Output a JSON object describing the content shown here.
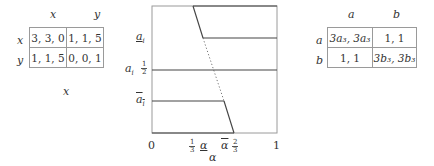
{
  "left_game": {
    "col_headers": [
      "x",
      "y"
    ],
    "row_headers": [
      "x",
      "y"
    ],
    "cells": [
      [
        "3, 3, 0",
        "1, 1, 5"
      ],
      [
        "1, 1, 5",
        "0, 0, 1"
      ]
    ],
    "bottom_label": "x"
  },
  "graph": {
    "x_axis_label": "α",
    "x_ticks": {
      "zero": "0",
      "one_third_num": "1",
      "one_third_den": "3",
      "alpha_lower": "α",
      "alpha_upper": "α",
      "two_thirds_num": "2",
      "two_thirds_den": "3",
      "one": "1"
    },
    "y_ticks": {
      "a_lower": "a",
      "a_i": "a",
      "a_i_sub": "i",
      "a_lower_sub": "i",
      "half_num": "1",
      "half_den": "2",
      "a_upper": "a",
      "a_upper_sub": "i"
    }
  },
  "right_game": {
    "col_headers": [
      "a",
      "b"
    ],
    "row_headers": [
      "a",
      "b"
    ],
    "cells": [
      [
        "3a₃, 3a₃",
        "1, 1"
      ],
      [
        "1, 1",
        "3b₃, 3b₃"
      ]
    ]
  }
}
